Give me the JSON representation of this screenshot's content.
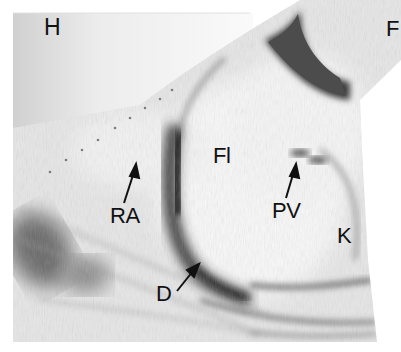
{
  "figure": {
    "type": "ultrasound-scan",
    "orientation_labels": [
      {
        "id": "H",
        "text": "H",
        "x": 44,
        "y": 17,
        "size": 22
      },
      {
        "id": "F",
        "text": "F",
        "x": 386,
        "y": 18,
        "size": 22
      }
    ],
    "structure_labels": [
      {
        "id": "Fl",
        "text": "Fl",
        "x": 213,
        "y": 145,
        "size": 22
      },
      {
        "id": "RA",
        "text": "RA",
        "x": 111,
        "y": 205,
        "size": 22
      },
      {
        "id": "PV",
        "text": "PV",
        "x": 272,
        "y": 201,
        "size": 22
      },
      {
        "id": "K",
        "text": "K",
        "x": 337,
        "y": 225,
        "size": 22
      },
      {
        "id": "D",
        "text": "D",
        "x": 156,
        "y": 284,
        "size": 22
      }
    ],
    "arrows": [
      {
        "for": "RA",
        "x1": 124,
        "y1": 203,
        "x2": 136,
        "y2": 166
      },
      {
        "for": "PV",
        "x1": 286,
        "y1": 198,
        "x2": 296,
        "y2": 165
      },
      {
        "for": "D",
        "x1": 177,
        "y1": 291,
        "x2": 198,
        "y2": 265
      }
    ],
    "colors": {
      "background": "#ffffff",
      "tissue_light": "#f2f2f2",
      "tissue_mid": "#c8c8c8",
      "tissue_dark": "#3a3a3a",
      "label": "#111111"
    }
  },
  "labels": {
    "H": "H",
    "F": "F",
    "Fl": "Fl",
    "RA": "RA",
    "PV": "PV",
    "K": "K",
    "D": "D"
  }
}
